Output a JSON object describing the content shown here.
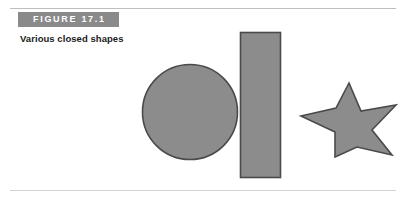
{
  "figure": {
    "banner_label": "FIGURE 17.1",
    "caption": "Various closed shapes"
  },
  "colors": {
    "banner_background": "#8a8a8a",
    "banner_text": "#ffffff",
    "caption_text": "#1c1c1c",
    "shape_fill": "#8c8c8c",
    "shape_stroke": "#4a4a4a",
    "rule": "#bdbdbd",
    "page_background": "#ffffff"
  },
  "shapes": [
    {
      "name": "circle",
      "kind": "circle",
      "center_x": 190,
      "center_y": 112,
      "radius": 48,
      "fill": "#8c8c8c",
      "stroke": "#4a4a4a"
    },
    {
      "name": "rectangle",
      "kind": "rect",
      "x": 240,
      "y": 32,
      "width": 41,
      "height": 146,
      "fill": "#8c8c8c",
      "stroke": "#4a4a4a"
    },
    {
      "name": "star",
      "kind": "polygon",
      "points": "349,83 365,117 398,104 375,132 396,151 360,149 341,157 334,133 301,113 336,110",
      "fill": "#8c8c8c",
      "stroke": "#4a4a4a"
    }
  ]
}
